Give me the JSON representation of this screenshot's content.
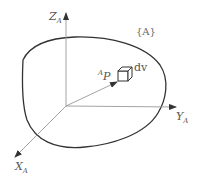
{
  "diagram": {
    "frame_label": "{A}",
    "axes": {
      "z": {
        "name": "Z",
        "subscript": "A"
      },
      "y": {
        "name": "Y",
        "subscript": "A"
      },
      "x": {
        "name": "X",
        "subscript": "A"
      }
    },
    "vector": {
      "superscript": "A",
      "name": "P"
    },
    "volume_element": "dv",
    "colors": {
      "stroke": "#333333",
      "axis": "#888888",
      "text": "#555555"
    }
  }
}
